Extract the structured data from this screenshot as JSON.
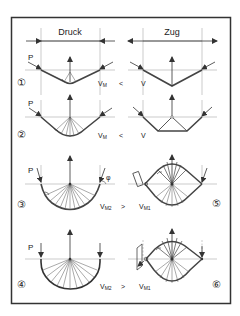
{
  "header": {
    "left": "Druck",
    "right": "Zug"
  },
  "force_label": "P",
  "angle_label": "φ",
  "rows": [
    {
      "num_left": "①",
      "left_label": "V",
      "left_sub": "M",
      "relation": "<",
      "right_label": "V",
      "right_sub": "",
      "num_right": ""
    },
    {
      "num_left": "②",
      "left_label": "V",
      "left_sub": "M",
      "relation": "<",
      "right_label": "V",
      "right_sub": "",
      "num_right": ""
    },
    {
      "num_left": "③",
      "left_label": "V",
      "left_sub": "M2",
      "relation": ">",
      "right_label": "V",
      "right_sub": "M1",
      "num_right": "⑤"
    },
    {
      "num_left": "④",
      "left_label": "V",
      "left_sub": "M2",
      "relation": ">",
      "right_label": "V",
      "right_sub": "M1",
      "num_right": "⑥"
    }
  ],
  "colors": {
    "line": "#333333",
    "thin": "#555555",
    "guide": "#999999",
    "frame": "#333333"
  }
}
